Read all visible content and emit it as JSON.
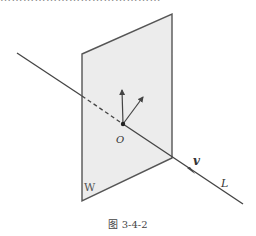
{
  "top_text_clipped": "……………………………………",
  "figure": {
    "plane_label": "W",
    "line_label": "L",
    "direction_label": "v",
    "point_label": "O",
    "caption": "图 3-4-2",
    "colors": {
      "plane_fill": "#ececec",
      "stroke": "#444444",
      "text": "#333333"
    }
  }
}
